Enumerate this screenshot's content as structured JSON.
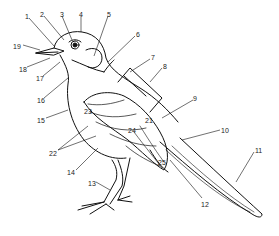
{
  "diagram": {
    "labels": [
      {
        "n": "1",
        "x": 25,
        "y": 13
      },
      {
        "n": "2",
        "x": 40,
        "y": 11
      },
      {
        "n": "3",
        "x": 60,
        "y": 11
      },
      {
        "n": "4",
        "x": 79,
        "y": 11
      },
      {
        "n": "5",
        "x": 107,
        "y": 11
      },
      {
        "n": "6",
        "x": 136,
        "y": 31
      },
      {
        "n": "7",
        "x": 151,
        "y": 54
      },
      {
        "n": "8",
        "x": 163,
        "y": 63
      },
      {
        "n": "9",
        "x": 193,
        "y": 95
      },
      {
        "n": "10",
        "x": 221,
        "y": 127
      },
      {
        "n": "11",
        "x": 255,
        "y": 147
      },
      {
        "n": "12",
        "x": 201,
        "y": 201
      },
      {
        "n": "13",
        "x": 88,
        "y": 180
      },
      {
        "n": "14",
        "x": 67,
        "y": 169
      },
      {
        "n": "15",
        "x": 37,
        "y": 117
      },
      {
        "n": "16",
        "x": 37,
        "y": 97
      },
      {
        "n": "17",
        "x": 36,
        "y": 75
      },
      {
        "n": "18",
        "x": 19,
        "y": 66
      },
      {
        "n": "19",
        "x": 13,
        "y": 43
      },
      {
        "n": "21",
        "x": 145,
        "y": 117
      },
      {
        "n": "22",
        "x": 49,
        "y": 150
      },
      {
        "n": "23",
        "x": 84,
        "y": 108
      },
      {
        "n": "24",
        "x": 128,
        "y": 127
      },
      {
        "n": "25",
        "x": 158,
        "y": 159
      }
    ]
  }
}
